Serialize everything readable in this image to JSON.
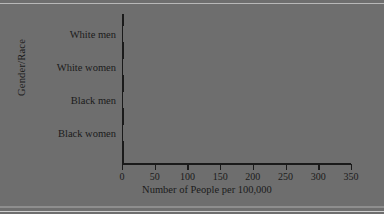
{
  "chart_data": {
    "type": "bar",
    "orientation": "horizontal",
    "title": "",
    "categories": [
      "White men",
      "White women",
      "Black men",
      "Black women"
    ],
    "values": [
      145,
      119,
      276,
      222
    ],
    "xlabel": "Number of People per 100,000",
    "ylabel": "Gender/Race",
    "xlim": [
      0,
      350
    ],
    "xticks": [
      "0",
      "50",
      "100",
      "150",
      "200",
      "250",
      "300",
      "350"
    ],
    "xtick_values": [
      0,
      50,
      100,
      150,
      200,
      250,
      300,
      350
    ],
    "grid": false,
    "legend": false,
    "bar_color": "#6e6e6e",
    "axis_color": "#1a1a1a",
    "background": "#ffffff"
  }
}
